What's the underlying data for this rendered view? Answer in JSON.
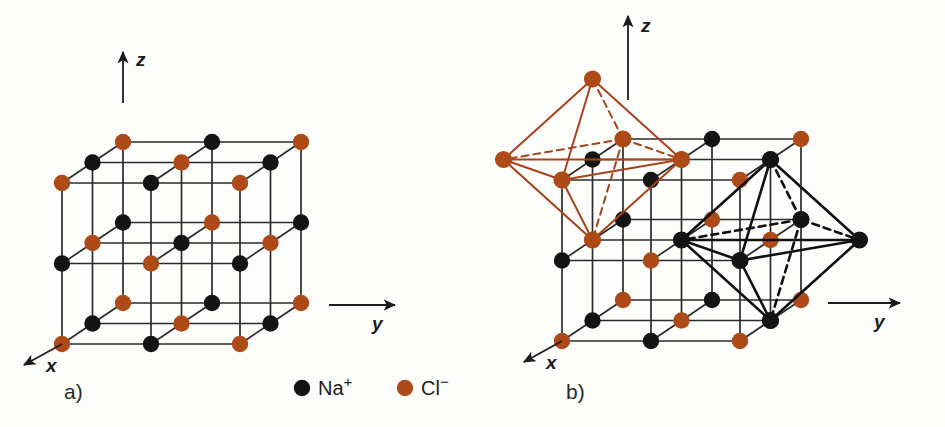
{
  "figure": {
    "background": "#fdfdfb",
    "width": 945,
    "height": 427
  },
  "colors": {
    "sodium": "#141414",
    "chlorine": "#AE4A18",
    "bond_line": "#2b2b2b",
    "octahedron_na": "#101010",
    "octahedron_cl": "#A8421A",
    "text": "#1c1c1c"
  },
  "legend": {
    "items": [
      {
        "name": "sodium-ion",
        "symbol": "Na",
        "charge": "+",
        "color": "#141414",
        "marker": "filled-circle",
        "cx": 302,
        "cy": 388
      },
      {
        "name": "chloride-ion",
        "symbol": "Cl",
        "charge": "−",
        "color": "#AE4A18",
        "marker": "filled-circle",
        "cx": 405,
        "cy": 388
      }
    ]
  },
  "panels": [
    {
      "id": "a",
      "label": "a)",
      "label_pos": {
        "x": 64,
        "y": 399
      },
      "caption": "Rock-salt lattice: 3×3×3 array of alternating Na+ and Cl- ions",
      "axes": {
        "origin": {
          "x": 62,
          "y": 344
        },
        "z": {
          "label": "z",
          "tip": {
            "x": 123,
            "y": 52
          },
          "base": {
            "x": 123,
            "y": 103
          },
          "label_pos": {
            "x": 136,
            "y": 66
          }
        },
        "y": {
          "label": "y",
          "tip": {
            "x": 395,
            "y": 305
          },
          "base": {
            "x": 329,
            "y": 305
          },
          "label_pos": {
            "x": 372,
            "y": 330
          }
        },
        "x": {
          "label": "x",
          "tip": {
            "x": 24,
            "y": 365
          },
          "base": {
            "x": 62,
            "y": 344
          },
          "label_pos": {
            "x": 46,
            "y": 372
          }
        }
      },
      "lattice": {
        "n": 3,
        "origin": {
          "x": 62,
          "y": 344
        },
        "unit_y": {
          "dx": 89,
          "dy": 0
        },
        "unit_z": {
          "dx": 0,
          "dy": -80.5
        },
        "unit_x": {
          "dx": 30.5,
          "dy": -20.5
        },
        "ion_rule": "Na+ when (i+j+k) odd, Cl- when (i+j+k) even",
        "radius": 8.2,
        "counts": {
          "chlorine": 14,
          "sodium": 13,
          "total_sites": 27
        }
      }
    },
    {
      "id": "b",
      "label": "b)",
      "label_pos": {
        "x": 566,
        "y": 399
      },
      "caption": "Coordination octahedra: Cl- around Na+ (red) and Na+ around Cl- (black)",
      "axes": {
        "origin": {
          "x": 562,
          "y": 341
        },
        "z": {
          "label": "z",
          "tip": {
            "x": 628,
            "y": 16
          },
          "base": {
            "x": 628,
            "y": 100
          },
          "label_pos": {
            "x": 641,
            "y": 32
          }
        },
        "y": {
          "label": "y",
          "tip": {
            "x": 900,
            "y": 303
          },
          "base": {
            "x": 828,
            "y": 303
          },
          "label_pos": {
            "x": 874,
            "y": 328
          }
        },
        "x": {
          "label": "x",
          "tip": {
            "x": 524,
            "y": 362
          },
          "base": {
            "x": 562,
            "y": 341
          },
          "label_pos": {
            "x": 546,
            "y": 369
          }
        }
      },
      "lattice": {
        "n": 3,
        "origin": {
          "x": 562,
          "y": 341
        },
        "unit_y": {
          "dx": 89,
          "dy": 0
        },
        "unit_z": {
          "dx": 0,
          "dy": -80.5
        },
        "unit_x": {
          "dx": 30.5,
          "dy": -20.5
        },
        "radius": 8.2
      },
      "octahedra": [
        {
          "name": "chloride-octahedron",
          "element": "Cl",
          "color": "#A8421A",
          "center_site": [
            1,
            0,
            2
          ],
          "stroke_width": 2.0,
          "vertex_radius": 8.6,
          "description": "Six Cl- ions coordinating a central Na+ ion"
        },
        {
          "name": "sodium-octahedron",
          "element": "Na",
          "color": "#101010",
          "center_site": [
            1,
            2,
            1
          ],
          "stroke_width": 2.6,
          "vertex_radius": 8.6,
          "description": "Six Na+ ions coordinating a central Cl- ion"
        }
      ]
    }
  ]
}
